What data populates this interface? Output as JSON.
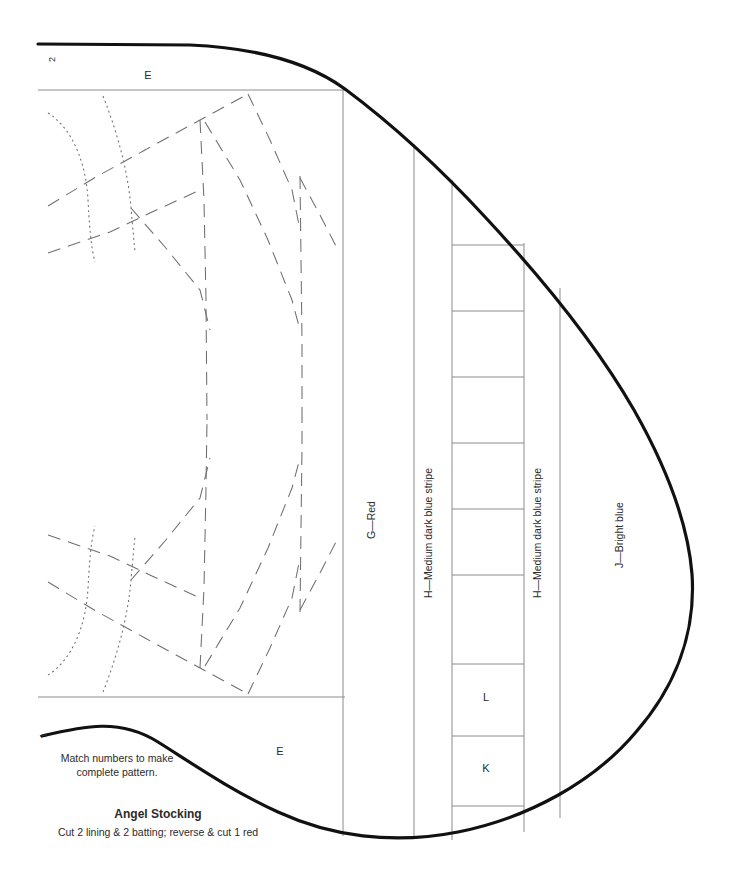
{
  "document": {
    "type": "sewing-pattern-sheet",
    "title": "Angel Stocking",
    "subtitle": "Cut 2 lining & 2 batting; reverse & cut 1 red",
    "match_note_line1": "Match numbers to make",
    "match_note_line2": "complete pattern."
  },
  "match_markers": [
    {
      "id": "marker-2",
      "label": "2",
      "x": 55,
      "y": 62,
      "rotation": -90
    },
    {
      "id": "marker-1",
      "label": "1",
      "x": 46,
      "y": 738,
      "rotation": -90
    }
  ],
  "section_labels": [
    {
      "id": "label-e-top",
      "label": "E",
      "x": 148,
      "y": 79
    },
    {
      "id": "label-e-bottom",
      "label": "E",
      "x": 280,
      "y": 755
    }
  ],
  "cell_labels": [
    {
      "id": "cell-l",
      "label": "L",
      "x": 486,
      "y": 701
    },
    {
      "id": "cell-k",
      "label": "K",
      "x": 486,
      "y": 772
    }
  ],
  "vertical_labels": [
    {
      "id": "strip-g",
      "label": "G—Red",
      "x": 375,
      "y": 520
    },
    {
      "id": "strip-h-left",
      "label": "H—Medium dark blue stripe",
      "x": 432,
      "y": 533
    },
    {
      "id": "strip-h-right",
      "label": "H—Medium dark blue stripe",
      "x": 541,
      "y": 533
    },
    {
      "id": "strip-j",
      "label": "J—Bright blue",
      "x": 623,
      "y": 535
    }
  ],
  "geometry": {
    "sheet_width": 745,
    "sheet_height": 884,
    "outline_path": "M 38 44 L 200 45 C 268 47 312 61 345 88 C 410 138 470 200 528 268 C 586 337 640 410 672 478 C 700 538 704 592 688 648 C 668 718 612 780 540 818 C 470 855 392 858 325 832 C 268 810 220 776 180 748 C 140 720 98 726 42 735",
    "top_rule": {
      "x1": 38,
      "y1": 90,
      "x2": 345,
      "y2": 90
    },
    "bottom_rule": {
      "x1": 38,
      "y1": 697,
      "x2": 345,
      "y2": 697
    },
    "left_panel_right_edge": {
      "x": 343,
      "y1": 88,
      "y2": 836
    },
    "columns": [
      {
        "id": "column-g",
        "x_left": 343,
        "x_right": 414,
        "label_ref": "strip-g"
      },
      {
        "id": "column-h-left",
        "x_left": 414,
        "x_right": 452,
        "label_ref": "strip-h-left"
      },
      {
        "id": "column-ladder",
        "x_left": 452,
        "x_right": 524,
        "label_ref": "cells"
      },
      {
        "id": "column-h-right",
        "x_left": 524,
        "x_right": 560,
        "label_ref": "strip-h-right"
      },
      {
        "id": "column-j",
        "x_left": 560,
        "x_right": 700,
        "label_ref": "strip-j"
      }
    ],
    "ladder_rung_y": [
      245,
      311,
      377,
      443,
      509,
      575,
      641,
      664,
      736,
      806
    ],
    "colors": {
      "outline": "#111111",
      "guide": "#8c8c8c",
      "construction": "#6f6f6f",
      "text": "#2b2b2b",
      "background": "#ffffff"
    }
  }
}
